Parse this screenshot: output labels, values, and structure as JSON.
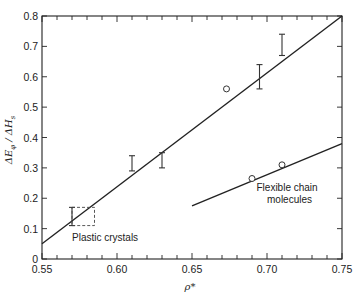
{
  "chart_data": {
    "type": "scatter",
    "title": "",
    "xlabel": "ρ*",
    "ylabel": "ΔE_φ / ΔH_s",
    "xlim": [
      0.55,
      0.75
    ],
    "ylim": [
      0,
      0.8
    ],
    "grid": false,
    "legend": "none",
    "x_ticks": [
      "0.55",
      "0.60",
      "0.65",
      "0.70",
      "0.75"
    ],
    "x_minor_step": 0.01,
    "y_ticks": [
      "0",
      "0.1",
      "0.2",
      "0.3",
      "0.4",
      "0.5",
      "0.6",
      "0.7",
      "0.8"
    ],
    "series": [
      {
        "name": "Plastic crystals",
        "kind": "line+errorbars",
        "line": [
          [
            0.55,
            0.05
          ],
          [
            0.75,
            0.8
          ]
        ],
        "error_bars": [
          {
            "x": 0.57,
            "low": 0.11,
            "high": 0.17
          },
          {
            "x": 0.61,
            "low": 0.29,
            "high": 0.34
          },
          {
            "x": 0.63,
            "low": 0.3,
            "high": 0.35
          },
          {
            "x": 0.695,
            "low": 0.56,
            "high": 0.64
          },
          {
            "x": 0.71,
            "low": 0.67,
            "high": 0.74
          }
        ],
        "points": [
          {
            "x": 0.673,
            "y": 0.56
          }
        ],
        "dashed_box": {
          "x0": 0.57,
          "x1": 0.585,
          "y0": 0.11,
          "y1": 0.17
        }
      },
      {
        "name": "Flexible chain molecules",
        "kind": "line+points",
        "line": [
          [
            0.65,
            0.175
          ],
          [
            0.75,
            0.38
          ]
        ],
        "points": [
          {
            "x": 0.69,
            "y": 0.265
          },
          {
            "x": 0.71,
            "y": 0.31
          }
        ]
      }
    ],
    "annotations": [
      {
        "text": "Plastic crystals",
        "x": 0.57,
        "y": 0.06
      },
      {
        "text": "Flexible chain",
        "x": 0.693,
        "y": 0.225
      },
      {
        "text": "molecules",
        "x": 0.7,
        "y": 0.185
      }
    ]
  },
  "labels": {
    "xlabel": "ρ*",
    "ylabel_main": "ΔE",
    "ylabel_sub1": "φ",
    "ylabel_mid": " / ΔH",
    "ylabel_sub2": "s",
    "plastic": "Plastic crystals",
    "flex1": "Flexible chain",
    "flex2": "molecules"
  }
}
